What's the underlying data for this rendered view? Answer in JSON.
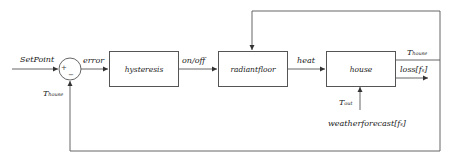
{
  "diagram": {
    "type": "control-loop block diagram",
    "input": {
      "label": "SetPoint"
    },
    "summing_junction": {
      "plus_sign": "+",
      "minus_sign": "−"
    },
    "signals": {
      "error": "error",
      "on_off": "on/off",
      "heat": "heat",
      "t_house_main": "T",
      "t_house_sub": "house",
      "t_house_feedback_main": "T",
      "t_house_feedback_sub": "house",
      "loss": "loss[f",
      "loss_sub": "s",
      "loss_close": "]",
      "t_out_main": "T",
      "t_out_sub": "out",
      "weather": "weatherforecast[f",
      "weather_sub": "s",
      "weather_close": "]"
    },
    "blocks": [
      {
        "id": "hysteresis",
        "label": "hysteresis"
      },
      {
        "id": "radiant-floor",
        "label": "radiantfloor"
      },
      {
        "id": "house",
        "label": "house"
      }
    ],
    "colors": {
      "line": "#555555",
      "text": "#222222",
      "background": "#ffffff"
    }
  }
}
